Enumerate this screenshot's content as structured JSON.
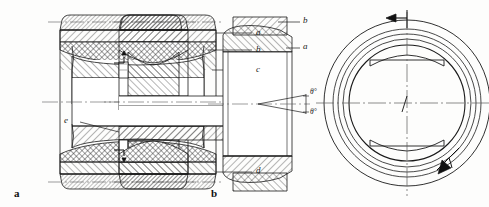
{
  "figure": {
    "background_color": "#fdfdfc",
    "line_color": "#1a1a1a",
    "hatch_color": "#333333"
  },
  "panel_a": {
    "caption": "a",
    "callouts": [
      {
        "id": "a",
        "label": "a",
        "描": "outer ring"
      },
      {
        "id": "b",
        "label": "b"
      },
      {
        "id": "c",
        "label": "c"
      },
      {
        "id": "d",
        "label": "d"
      },
      {
        "id": "e",
        "label": "e"
      }
    ]
  },
  "panel_b": {
    "caption": "b",
    "callouts": [
      {
        "id": "b",
        "label": "b"
      },
      {
        "id": "a",
        "label": "a"
      }
    ],
    "angles": [
      {
        "id": "upper",
        "label": "θ°"
      },
      {
        "id": "lower",
        "label": "θ°"
      }
    ]
  },
  "panel_c": {
    "caption": "",
    "arrows": [
      {
        "id": "top",
        "label": ""
      },
      {
        "id": "lower-right",
        "label": ""
      }
    ]
  }
}
